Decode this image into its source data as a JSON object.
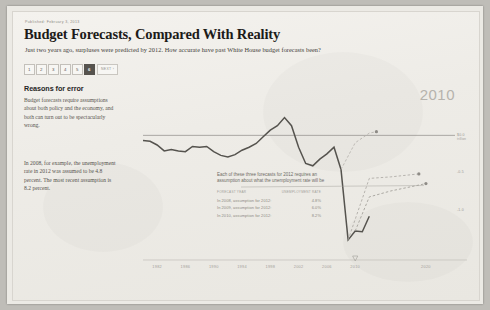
{
  "header": {
    "published": "Published: February 3, 2013",
    "headline": "Budget Forecasts, Compared With Reality",
    "subhead": "Just two years ago, surpluses were predicted by 2012. How accurate have past White House budget forecasts been?"
  },
  "pagination": {
    "pages": [
      "1",
      "2",
      "3",
      "4",
      "5",
      "6"
    ],
    "active": "6",
    "next_label": "NEXT ›"
  },
  "sidebar": {
    "title": "Reasons for error",
    "paragraph1": "Budget forecasts require assumptions about both policy and the economy, and both can turn out to be spectacularly wrong.",
    "paragraph2": "In 2008, for example, the unemployment rate in 2012 was assumed to be 4.8 percent. The most recent assumption is 8.2 percent."
  },
  "annotation": {
    "text": "Each of these three forecasts for 2012 requires an assumption about what the unemployment rate will be",
    "col_forecast": "FORECAST YEAR",
    "col_rate": "UNEMPLOYMENT RATE",
    "rows": [
      {
        "label": "In 2008, assumption for 2012:",
        "value": "4.8%"
      },
      {
        "label": "In 2009, assumption for 2012:",
        "value": "6.0%"
      },
      {
        "label": "In 2010, assumption for 2012:",
        "value": "8.2%"
      }
    ]
  },
  "chart_data": {
    "type": "line",
    "title": "Budget Forecasts, Compared With Reality",
    "highlight_year": "2010",
    "xlabel": "",
    "ylabel": "",
    "grid": false,
    "legend_position": "none",
    "xlim": [
      1980,
      2021
    ],
    "ylim": [
      -1.6,
      0.45
    ],
    "xticks": [
      "1982",
      "1986",
      "1990",
      "1994",
      "1998",
      "2002",
      "2006",
      "2010",
      "2020"
    ],
    "xtick_values": [
      1982,
      1986,
      1990,
      1994,
      1998,
      2002,
      2006,
      2010,
      2020
    ],
    "yticks": [
      "$0.0 trillion",
      "-0.5",
      "-1.0"
    ],
    "ytick_values": [
      0.0,
      -0.5,
      -1.0
    ],
    "zero_line": 0.0,
    "marker_year": 2010,
    "series": [
      {
        "name": "Actual surplus or deficit",
        "color": "#55534e",
        "x": [
          1980,
          1981,
          1982,
          1983,
          1984,
          1985,
          1986,
          1987,
          1988,
          1989,
          1990,
          1991,
          1992,
          1993,
          1994,
          1995,
          1996,
          1997,
          1998,
          1999,
          2000,
          2001,
          2002,
          2003,
          2004,
          2005,
          2006,
          2007,
          2008,
          2009,
          2010,
          2011,
          2012
        ],
        "values": [
          -0.07,
          -0.08,
          -0.13,
          -0.21,
          -0.19,
          -0.21,
          -0.22,
          -0.15,
          -0.16,
          -0.15,
          -0.22,
          -0.27,
          -0.29,
          -0.26,
          -0.2,
          -0.16,
          -0.11,
          -0.02,
          0.07,
          0.13,
          0.24,
          0.13,
          -0.16,
          -0.38,
          -0.41,
          -0.32,
          -0.25,
          -0.16,
          -0.46,
          -1.41,
          -1.29,
          -1.3,
          -1.09
        ]
      },
      {
        "name": "Forecast made in 2010",
        "color": "#9b9892",
        "dashed": true,
        "x": [
          2010,
          2012,
          2015,
          2020
        ],
        "values": [
          -1.29,
          -0.83,
          -0.75,
          -0.65
        ]
      },
      {
        "name": "Forecast made in 2009",
        "color": "#a8a5a0",
        "dashed": true,
        "x": [
          2009,
          2012,
          2015,
          2019
        ],
        "values": [
          -1.41,
          -0.58,
          -0.56,
          -0.52
        ]
      },
      {
        "name": "Forecast made in 2008",
        "color": "#b2afa9",
        "dashed": true,
        "x": [
          2008,
          2010,
          2012,
          2013
        ],
        "values": [
          -0.46,
          -0.1,
          0.03,
          0.05
        ]
      }
    ],
    "annotations": [
      "Each of these three forecasts for 2012 requires an assumption about what the unemployment rate will be"
    ]
  }
}
